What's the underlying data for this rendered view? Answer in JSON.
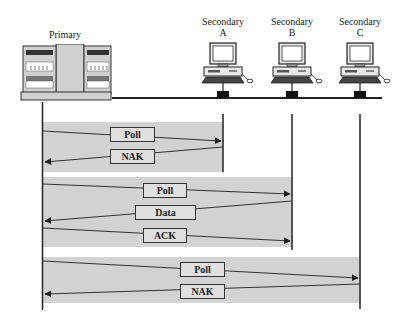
{
  "diagram": {
    "type": "polling-sequence",
    "colors": {
      "band": "#d3d3d3",
      "line": "#222222",
      "message_box": "#e0e0e0"
    },
    "primary": {
      "label": "Primary",
      "icon": "server-rack-icon"
    },
    "secondaries": [
      {
        "label_line1": "Secondary",
        "label_line2": "A",
        "icon": "desktop-computer-icon"
      },
      {
        "label_line1": "Secondary",
        "label_line2": "B",
        "icon": "desktop-computer-icon"
      },
      {
        "label_line1": "Secondary",
        "label_line2": "C",
        "icon": "desktop-computer-icon"
      }
    ],
    "exchanges": [
      {
        "target": "A",
        "messages": [
          {
            "label": "Poll",
            "direction": "primary-to-secondary"
          },
          {
            "label": "NAK",
            "direction": "secondary-to-primary"
          }
        ]
      },
      {
        "target": "B",
        "messages": [
          {
            "label": "Poll",
            "direction": "primary-to-secondary"
          },
          {
            "label": "Data",
            "direction": "secondary-to-primary"
          },
          {
            "label": "ACK",
            "direction": "primary-to-secondary"
          }
        ]
      },
      {
        "target": "C",
        "messages": [
          {
            "label": "Poll",
            "direction": "primary-to-secondary"
          },
          {
            "label": "NAK",
            "direction": "secondary-to-primary"
          }
        ]
      }
    ]
  }
}
